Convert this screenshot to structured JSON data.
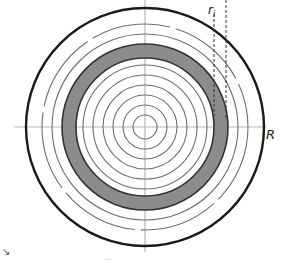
{
  "diagram": {
    "type": "concentric-annulus",
    "labels": {
      "axis_radius": "R",
      "ring_radius": "r",
      "ring_radius_subscript": "i"
    },
    "caption_fragment": "…",
    "corner_mark": "↘",
    "colors": {
      "outer_circle": "#1a1a1a",
      "inner_circles": "#6f6f6f",
      "shaded_ring": "#8c8c8c",
      "axes": "#b8b8b8",
      "dashed_lines": "#333333"
    },
    "geometry": {
      "center": [
        145,
        127
      ],
      "outer_radius": 119,
      "shaded_ring_outer_radius": 83,
      "shaded_ring_inner_radius": 69,
      "inner_circle_radii": [
        12,
        22,
        32,
        42,
        52,
        62
      ],
      "between_circle_radii": [
        93,
        103
      ]
    }
  }
}
